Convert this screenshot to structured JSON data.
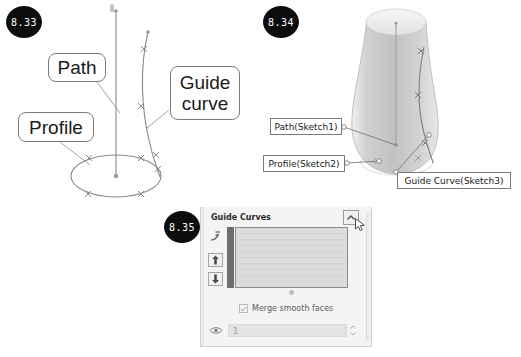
{
  "page": {
    "width": 521,
    "height": 357,
    "background": "#ffffff"
  },
  "figures": [
    {
      "id": "8.33",
      "badge_label": "8.33",
      "caption_labels": [
        "Path",
        "Profile",
        "Guide curve"
      ]
    },
    {
      "id": "8.34",
      "badge_label": "8.34",
      "caption_labels": [
        "Path(Sketch1)",
        "Profile(Sketch2)",
        "Guide Curve(Sketch3)"
      ]
    },
    {
      "id": "8.35",
      "badge_label": "8.35",
      "caption_labels": [
        "Guide Curves",
        "Merge smooth faces"
      ]
    }
  ],
  "fig833": {
    "badge": "8.33",
    "label_path": "Path",
    "label_profile": "Profile",
    "label_guide_line1": "Guide",
    "label_guide_line2": "curve",
    "stroke_color": "#808080"
  },
  "fig834": {
    "badge": "8.34",
    "label_path": "Path(Sketch1)",
    "label_profile": "Profile(Sketch2)",
    "label_guide": "Guide Curve(Sketch3)",
    "solid_color": "#b9b9b9",
    "stroke_color": "#6e6e6e"
  },
  "fig835": {
    "badge": "8.35",
    "panel_title": "Guide Curves",
    "merge_checkbox_label": "Merge smooth faces",
    "merge_checkbox_checked": true,
    "spinner_value": "1",
    "icons": {
      "collapse": "chevron-up-icon",
      "guide_curve": "guide-curve-icon",
      "move_up": "arrow-up-icon",
      "move_down": "arrow-down-icon",
      "tangency": "eye-icon",
      "spinner": "spinner-arrows-icon",
      "cursor": "mouse-cursor-icon"
    },
    "panel_bg": "#f4f4f4",
    "list_bar_color": "#6e6e6e"
  }
}
